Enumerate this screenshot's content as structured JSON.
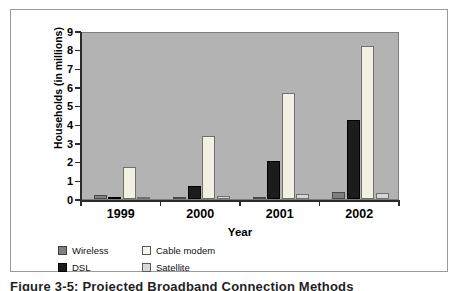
{
  "caption": {
    "text": "Figure 3-5:  Projected Broadband Connection Methods"
  },
  "chart_data": {
    "type": "bar",
    "title": "",
    "xlabel": "Year",
    "ylabel": "Households (in millions)",
    "categories": [
      "1999",
      "2000",
      "2001",
      "2002"
    ],
    "ylim": [
      0,
      9
    ],
    "yticks": [
      "0",
      "1",
      "2",
      "3",
      "4",
      "5",
      "6",
      "7",
      "8",
      "9"
    ],
    "grid": false,
    "legend_position": "below-plot",
    "plot_background": "#b3b3b3",
    "series": [
      {
        "name": "Wireless",
        "color": "#7f7f7f",
        "values": [
          0.2,
          0.05,
          0.1,
          0.4
        ]
      },
      {
        "name": "DSL",
        "color": "#1c1c1c",
        "values": [
          0.05,
          0.7,
          2.05,
          4.25
        ]
      },
      {
        "name": "Cable modem",
        "color": "#f2efe3",
        "values": [
          1.7,
          3.4,
          5.7,
          8.2
        ]
      },
      {
        "name": "Satellite",
        "color": "#d6d6d6",
        "values": [
          0.1,
          0.15,
          0.25,
          0.3
        ]
      }
    ]
  },
  "legend": {
    "items": [
      {
        "label": "Wireless",
        "swatch": "wireless"
      },
      {
        "label": "Cable modem",
        "swatch": "cable"
      },
      {
        "label": "DSL",
        "swatch": "dsl"
      },
      {
        "label": "Satellite",
        "swatch": "satellite"
      }
    ]
  }
}
